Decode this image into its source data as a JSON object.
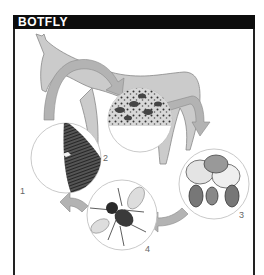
{
  "header": {
    "title": "BOTFLY"
  },
  "diagram": {
    "stages": [
      {
        "number": "1",
        "description": "eggs laid on horse hair"
      },
      {
        "number": "2",
        "description": "larvae in stomach"
      },
      {
        "number": "3",
        "description": "larvae/pupae"
      },
      {
        "number": "4",
        "description": "adult botfly"
      }
    ]
  },
  "colors": {
    "header_bg": "#0d0d0d",
    "header_text": "#ffffff",
    "horse_fill": "#c8c8c8",
    "arrow_fill": "#b0b0b0",
    "border": "#222222"
  }
}
